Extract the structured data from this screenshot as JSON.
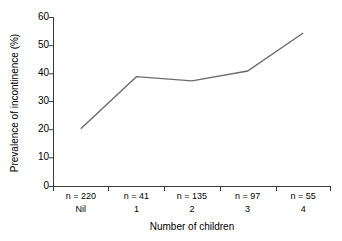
{
  "chart_data": {
    "type": "line",
    "title": "",
    "xlabel": "Number of children",
    "ylabel": "Prevalence of incontinence (%)",
    "categories": [
      "Nil",
      "1",
      "2",
      "3",
      "4"
    ],
    "group_counts": [
      "n = 220",
      "n = 41",
      "n = 135",
      "n = 97",
      "n = 55"
    ],
    "values": [
      20.5,
      39.0,
      37.5,
      41.0,
      54.5
    ],
    "ylim": [
      0,
      60
    ],
    "yticks": [
      0,
      10,
      20,
      30,
      40,
      50,
      60
    ],
    "ytick_labels": [
      "0",
      "10",
      "20",
      "30",
      "40",
      "50",
      "60"
    ],
    "grid": false,
    "legend": null,
    "line_color": "#6b6b6b",
    "axis_color": "#3a3a3a",
    "background_color": "#ffffff"
  },
  "axes": {
    "y": {
      "title": "Prevalence of incontinence (%)",
      "ticks": [
        {
          "label": "60",
          "value": 60
        },
        {
          "label": "50",
          "value": 50
        },
        {
          "label": "40",
          "value": 40
        },
        {
          "label": "30",
          "value": 30
        },
        {
          "label": "20",
          "value": 20
        },
        {
          "label": "10",
          "value": 10
        },
        {
          "label": "0",
          "value": 0
        }
      ]
    },
    "x": {
      "title": "Number of children",
      "categories": [
        {
          "count_label": "n = 220",
          "category_label": "Nil"
        },
        {
          "count_label": "n = 41",
          "category_label": "1"
        },
        {
          "count_label": "n = 135",
          "category_label": "2"
        },
        {
          "count_label": "n = 97",
          "category_label": "3"
        },
        {
          "count_label": "n = 55",
          "category_label": "4"
        }
      ]
    }
  }
}
